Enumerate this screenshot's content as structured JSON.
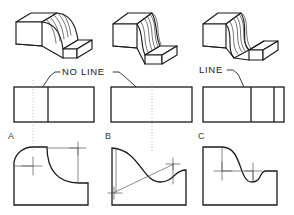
{
  "figure": {
    "callouts": {
      "no_line_label": "NO  LINE",
      "line_label": "LINE"
    },
    "view_letters": {
      "a": "A",
      "b": "B",
      "c": "C"
    },
    "caption": "",
    "colors": {
      "object_stroke": "#1a1a1a",
      "thin_stroke": "#2b2b2b",
      "projection": "#9a9a9a",
      "center_mark": "#555555",
      "construction": "#5a5a5a",
      "background": "#ffffff"
    }
  },
  "pictorials": [
    {
      "id": "pictorial-a",
      "name": "block-with-concave-fillet",
      "description": "Isometric block, tall left end, single concave curve blending tangentially into the low right platform",
      "tangent_at_top": true,
      "tangent_at_bottom": true,
      "surface_hatch_count": 6
    },
    {
      "id": "pictorial-b",
      "name": "block-with-ogee-surface",
      "description": "Isometric block with S-shaped (ogee) curved surface running from the tall left end to the low right platform, tangent at both ends",
      "tangent_at_top": true,
      "tangent_at_bottom": true,
      "surface_hatch_count": 6
    },
    {
      "id": "pictorial-c",
      "name": "block-with-undercut-ogee-surface",
      "description": "Isometric block with deep S-curve that drops below the platform level, producing a visible intersection edge on the right",
      "tangent_at_top": true,
      "tangent_at_bottom": false,
      "surface_hatch_count": 6
    }
  ],
  "top_views": [
    {
      "id": "topview-a",
      "name": "top-view-a",
      "internal_vertical_lines": 1,
      "callout": "NO  LINE",
      "arrow_target": "tangent point, no line shown"
    },
    {
      "id": "topview-b",
      "name": "top-view-b",
      "internal_vertical_lines": 0,
      "callout": "NO  LINE",
      "arrow_target": "tangent point, no line shown"
    },
    {
      "id": "topview-c",
      "name": "top-view-c",
      "internal_vertical_lines": 2,
      "callout": "LINE",
      "arrow_target": "intersection edge, line shown"
    }
  ],
  "profile_views": [
    {
      "id": "profile-a",
      "letter": "A",
      "name": "profile-view-a",
      "description": "Convex arc at upper left tangent to a larger concave arc sweeping down to the low right step",
      "center_marks": 2,
      "construction_lines": 2
    },
    {
      "id": "profile-b",
      "letter": "B",
      "name": "profile-view-b",
      "description": "Ogee (reverse) curve from the tall left edge down to a concave pocket at the right, built on a diagonal construction line",
      "center_marks": 2,
      "construction_lines": 1
    },
    {
      "id": "profile-c",
      "letter": "C",
      "name": "profile-view-c",
      "description": "Convex arc dropping into a deep concave pocket below platform level, centers joined by a horizontal construction line",
      "center_marks": 2,
      "construction_lines": 1
    }
  ]
}
